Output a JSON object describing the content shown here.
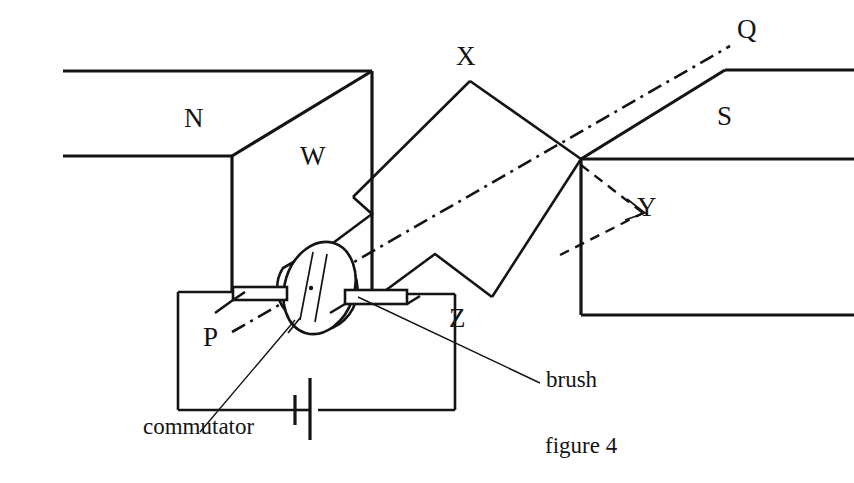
{
  "figure": {
    "caption": "figure 4",
    "title": "figure 4",
    "ink_color": "#141414",
    "background_color": "#ffffff",
    "width": 854,
    "height": 483
  },
  "magnet": {
    "north_pole_label": "N",
    "south_pole_label": "S"
  },
  "coil": {
    "vertices": [
      {
        "id": "W",
        "label": "W",
        "x": 355,
        "y": 195
      },
      {
        "id": "X",
        "label": "X",
        "x": 470,
        "y": 80
      },
      {
        "id": "Y",
        "label": "Y",
        "x": 580,
        "y": 160
      },
      {
        "id": "Z",
        "label": "Z",
        "x": 492,
        "y": 297
      }
    ]
  },
  "axis": {
    "near_label": "P",
    "far_label": "Q",
    "style": "dash-dot",
    "description": "rotation axis PQ"
  },
  "annotations": {
    "commutator_label": "commutator",
    "brush_label": "brush"
  },
  "circuit": {
    "cell_symbol": "battery-cell",
    "brush_count": 2
  }
}
